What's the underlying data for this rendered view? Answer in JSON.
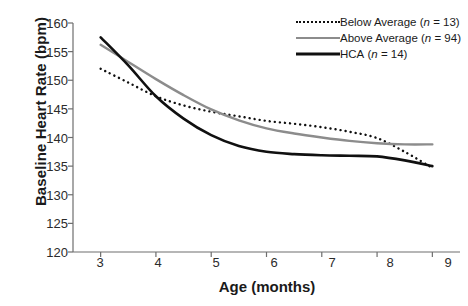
{
  "chart_data": {
    "type": "line",
    "title": "",
    "xlabel": "Age (months)",
    "ylabel": "Baseline Heart Rate (bpm)",
    "xlim": [
      2.5,
      9.5
    ],
    "ylim": [
      120,
      160
    ],
    "xticks": [
      3,
      4,
      5,
      6,
      7,
      8,
      9
    ],
    "yticks": [
      120,
      125,
      130,
      135,
      140,
      145,
      150,
      155,
      160
    ],
    "grid": false,
    "legend_position": "top-right",
    "x": [
      3,
      3.5,
      4,
      4.5,
      5,
      5.5,
      6,
      6.5,
      7,
      7.5,
      8,
      8.5,
      9
    ],
    "series": [
      {
        "name": "Below Average (n = 13)",
        "label_main": "Below Average",
        "label_n": "(n = 13)",
        "n": 13,
        "style": "dotted",
        "color": "#101010",
        "values": [
          152.0,
          149.6,
          147.2,
          145.6,
          144.5,
          143.7,
          142.9,
          142.4,
          141.8,
          141.0,
          139.9,
          137.5,
          134.7
        ]
      },
      {
        "name": "Above Average (n = 94)",
        "label_main": "Above Average",
        "label_n": "(n = 94)",
        "n": 94,
        "style": "solid-gray",
        "color": "#8c8c8c",
        "values": [
          156.2,
          153.2,
          150.2,
          147.4,
          144.9,
          143.0,
          141.6,
          140.7,
          140.0,
          139.4,
          139.0,
          138.8,
          138.8
        ]
      },
      {
        "name": "HCA (n = 14)",
        "label_main": "HCA",
        "label_n": "(n = 14)",
        "n": 14,
        "style": "solid-black",
        "color": "#101010",
        "values": [
          157.5,
          152.6,
          147.2,
          143.3,
          140.4,
          138.5,
          137.5,
          137.1,
          136.9,
          136.8,
          136.7,
          136.0,
          135.0
        ]
      }
    ]
  },
  "axes": {
    "xlabel": "Age (months)",
    "ylabel": "Baseline Heart Rate (bpm)",
    "ytick_labels": [
      "160",
      "155",
      "150",
      "145",
      "140",
      "135",
      "130",
      "125",
      "120"
    ],
    "xtick_labels": [
      "3",
      "4",
      "5",
      "6",
      "7",
      "8",
      "9"
    ]
  },
  "legend": {
    "items": [
      {
        "label_main": "Below Average",
        "label_n": "(n = 13)",
        "n_prefix": "(n",
        "n_value": "= 13)"
      },
      {
        "label_main": "Above Average",
        "label_n": "(n = 94)",
        "n_prefix": "(n",
        "n_value": "= 94)"
      },
      {
        "label_main": "HCA",
        "label_n": "(n = 14)",
        "n_prefix": "(n",
        "n_value": "= 14)"
      }
    ]
  }
}
